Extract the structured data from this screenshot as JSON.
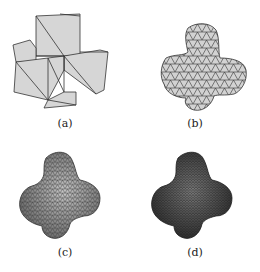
{
  "figure": {
    "panels": [
      {
        "id": "a",
        "caption": "(a)",
        "description": "coarse cube-cross mesh"
      },
      {
        "id": "b",
        "caption": "(b)",
        "description": "one subdivision step"
      },
      {
        "id": "c",
        "caption": "(c)",
        "description": "two subdivision steps"
      },
      {
        "id": "d",
        "caption": "(d)",
        "description": "dense smooth mesh"
      }
    ],
    "colors": {
      "face": "#d4d4d4",
      "edge": "#333333",
      "dark": "#4a4a4a"
    }
  }
}
